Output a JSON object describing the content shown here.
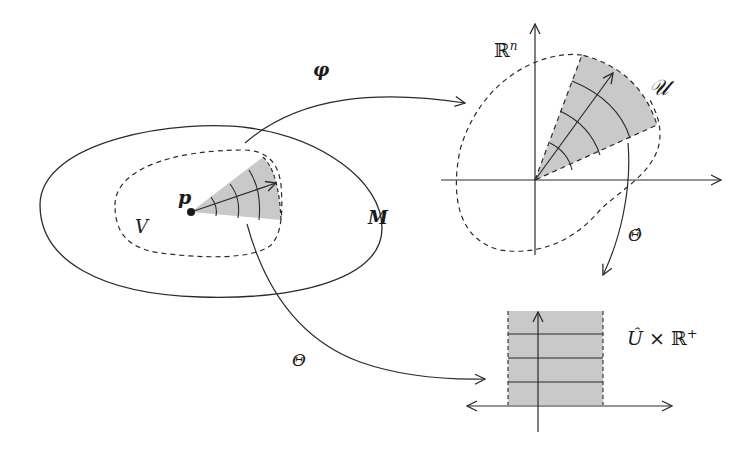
{
  "diagram": {
    "colors": {
      "stroke": "#2b2b2b",
      "shade": "#c9c9c9",
      "background": "#ffffff"
    },
    "labels": {
      "manifold": "M",
      "neighborhood": "V",
      "point": "p",
      "chart_map": "φ",
      "euclidean_space": "ℝ",
      "euclidean_exponent": "n",
      "sector": "𝒰",
      "theta_hat": "Θ̂",
      "theta": "Θ",
      "product_space_U": "Û",
      "product_space_times": "×",
      "product_space_R": "ℝ",
      "product_space_plus": "+"
    },
    "nodes": [
      {
        "id": "M",
        "shape": "ellipse",
        "style": "solid"
      },
      {
        "id": "V",
        "shape": "closed-curve",
        "style": "dashed"
      },
      {
        "id": "p",
        "shape": "dot"
      },
      {
        "id": "Rn",
        "shape": "axes"
      },
      {
        "id": "U",
        "shape": "shaded-sector"
      },
      {
        "id": "UhatxR+",
        "shape": "shaded-strip"
      }
    ],
    "edges": [
      {
        "from": "V",
        "to": "Rn",
        "label": "φ"
      },
      {
        "from": "U",
        "to": "UhatxR+",
        "label": "Θ̂"
      },
      {
        "from": "V",
        "to": "UhatxR+",
        "label": "Θ"
      }
    ]
  }
}
